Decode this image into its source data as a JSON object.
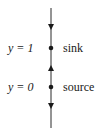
{
  "diagram": {
    "type": "phase-line",
    "line_color": "#2a2a2a",
    "equilibria": [
      {
        "value_label": "y = 1",
        "type_label": "sink"
      },
      {
        "value_label": "y = 0",
        "type_label": "source"
      }
    ],
    "arrows": [
      {
        "position": "above y=1",
        "direction": "down"
      },
      {
        "position": "between y=0 and y=1",
        "direction": "up"
      },
      {
        "position": "below y=0",
        "direction": "down"
      }
    ]
  }
}
